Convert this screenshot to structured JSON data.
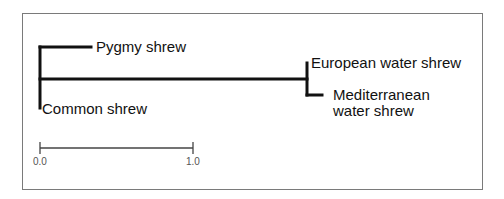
{
  "diagram": {
    "type": "phylogenetic-tree",
    "taxa": {
      "pygmy": "Pygmy shrew",
      "common": "Common shrew",
      "european": "European water shrew",
      "mediterranean_line1": "Mediterranean",
      "mediterranean_line2": "water shrew"
    },
    "scale_bar": {
      "start_label": "0.0",
      "end_label": "1.0"
    },
    "colors": {
      "branch": "#111111",
      "frame": "#7a7a7a",
      "scale": "#444444"
    }
  }
}
